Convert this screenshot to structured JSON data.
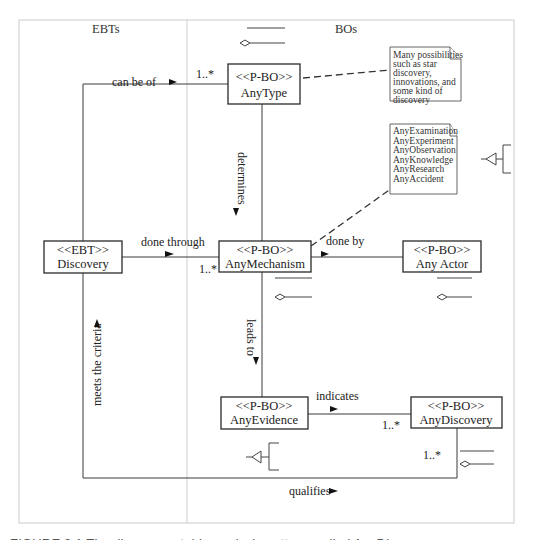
{
  "lanes": {
    "left": "EBTs",
    "right": "BOs"
  },
  "classes": [
    {
      "id": "anytype",
      "stereotype": "<<P-BO>>",
      "name": "AnyType"
    },
    {
      "id": "discovery",
      "stereotype": "<<EBT>>",
      "name": "Discovery"
    },
    {
      "id": "anymechanism",
      "stereotype": "<<P-BO>>",
      "name": "AnyMechanism"
    },
    {
      "id": "anyactor",
      "stereotype": "<<P-BO>>",
      "name": "Any Actor"
    },
    {
      "id": "anyevidence",
      "stereotype": "<<P-BO>>",
      "name": "AnyEvidence"
    },
    {
      "id": "anydiscovery",
      "stereotype": "<<P-BO>>",
      "name": "AnyDiscovery"
    }
  ],
  "associations": {
    "can_be_of": "can be of",
    "determines": "determines",
    "done_through": "done through",
    "done_by": "done by",
    "leads_to": "leads to",
    "indicates": "indicates",
    "meets_the_criteria": "meets the criteria",
    "qualifies": "qualifies"
  },
  "multiplicities": {
    "anytype": "1..*",
    "anymechanism": "1..*",
    "anydiscovery_indicates": "1..*",
    "anydiscovery_qualifies": "1..*"
  },
  "notes": {
    "type_note": [
      "Many possibilities",
      "such as star",
      "discovery,",
      "innovations, and",
      "some kind of",
      "discovery"
    ],
    "mechanism_note": [
      "AnyExamination",
      "AnyExperiment",
      "AnyObservation",
      "AnyKnowledge",
      "AnyResearch",
      "AnyAccident"
    ]
  },
  "caption": "FIGURE 3.1   The discovery stable analysis pattern, called AnyDiscovery"
}
